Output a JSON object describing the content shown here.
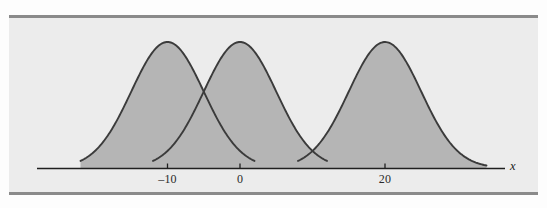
{
  "figure": {
    "background_color": "#ececec",
    "page_color": "#fdfdfd",
    "rule_color": "#8a8a8a",
    "curve_line_color": "#3b3b3b",
    "curve_fill_color": "#b5b5b5"
  },
  "axis": {
    "label": "x",
    "line_color": "#1f1f1f",
    "ticks": [
      {
        "label": "–10",
        "value": -10
      },
      {
        "label": "0",
        "value": 0
      },
      {
        "label": "20",
        "value": 20
      }
    ]
  },
  "chart_data": {
    "type": "line",
    "title": "",
    "subtitle": "",
    "xlabel": "x",
    "ylabel": "",
    "grid": false,
    "legend": null,
    "xlim": [
      -22,
      34
    ],
    "ylim": [
      0,
      1
    ],
    "tick_labels_x": [
      "–10",
      "0",
      "20"
    ],
    "tick_values_x": [
      -10,
      0,
      20
    ],
    "tick_labels_y": [],
    "annotations": [],
    "series": [
      {
        "name": "curve-1",
        "kind": "normal-density",
        "mean": -10,
        "std": 5,
        "peak_height": 1.0,
        "shaded": true,
        "x_start": -22,
        "x_end": 2
      },
      {
        "name": "curve-2",
        "kind": "normal-density",
        "mean": 0,
        "std": 5,
        "peak_height": 1.0,
        "shaded": true,
        "x_start": -12,
        "x_end": 12
      },
      {
        "name": "curve-3",
        "kind": "normal-density",
        "mean": 20,
        "std": 5,
        "peak_height": 1.0,
        "shaded": true,
        "x_start": 8,
        "x_end": 34
      }
    ]
  }
}
